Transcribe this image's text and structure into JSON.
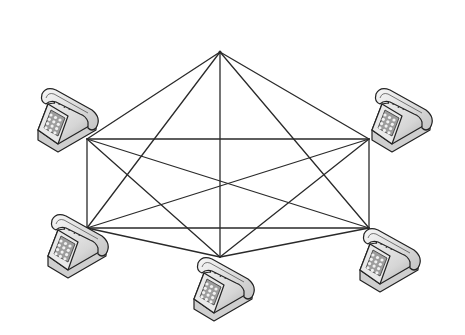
{
  "diagram": {
    "title": "Full mesh telephone network",
    "type": "full-mesh-topology",
    "node_icon": "telephone-icon",
    "line_color": "#2a2a2a",
    "nodes": [
      {
        "id": "top",
        "x": 220,
        "y": 52,
        "has_phone": false
      },
      {
        "id": "left",
        "x": 87,
        "y": 139,
        "has_phone": true,
        "phone_x": 34,
        "phone_y": 86
      },
      {
        "id": "right",
        "x": 369,
        "y": 139,
        "has_phone": true,
        "phone_x": 368,
        "phone_y": 86
      },
      {
        "id": "bottom-left",
        "x": 87,
        "y": 228,
        "has_phone": true,
        "phone_x": 44,
        "phone_y": 212
      },
      {
        "id": "bottom-center",
        "x": 220,
        "y": 257,
        "has_phone": true,
        "phone_x": 190,
        "phone_y": 255
      },
      {
        "id": "bottom-right",
        "x": 369,
        "y": 228,
        "has_phone": true,
        "phone_x": 356,
        "phone_y": 226
      }
    ],
    "edges": [
      [
        "top",
        "left"
      ],
      [
        "top",
        "right"
      ],
      [
        "top",
        "bottom-left"
      ],
      [
        "top",
        "bottom-center"
      ],
      [
        "top",
        "bottom-right"
      ],
      [
        "left",
        "right"
      ],
      [
        "left",
        "bottom-left"
      ],
      [
        "left",
        "bottom-center"
      ],
      [
        "left",
        "bottom-right"
      ],
      [
        "right",
        "bottom-left"
      ],
      [
        "right",
        "bottom-center"
      ],
      [
        "right",
        "bottom-right"
      ],
      [
        "bottom-left",
        "bottom-center"
      ],
      [
        "bottom-left",
        "bottom-right"
      ],
      [
        "bottom-center",
        "bottom-right"
      ]
    ]
  }
}
